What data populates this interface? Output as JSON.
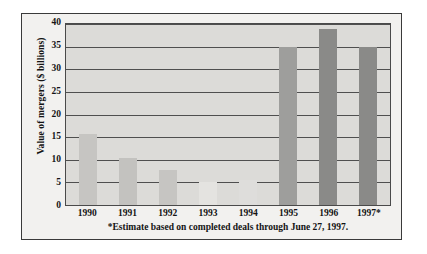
{
  "chart_data": {
    "type": "bar",
    "title": "",
    "xlabel": "",
    "ylabel": "Value of mergers ($ billions)",
    "categories": [
      "1990",
      "1991",
      "1992",
      "1993",
      "1994",
      "1995",
      "1996",
      "1997*"
    ],
    "values": [
      15.7,
      10.3,
      7.8,
      5.0,
      5.5,
      35.0,
      39.0,
      35.0
    ],
    "bar_colors": [
      "#c6c5c2",
      "#c3c2bf",
      "#c6c5c2",
      "#e4e3e0",
      "#dedddb",
      "#9e9e9c",
      "#8a8a88",
      "#8a8a88"
    ],
    "ylim": [
      0,
      40
    ],
    "yticks": [
      0,
      5,
      10,
      15,
      20,
      25,
      30,
      35,
      40
    ],
    "ytick_labels": [
      "0",
      "5",
      "10",
      "15",
      "20",
      "25",
      "30",
      "35",
      "40"
    ],
    "grid": true,
    "legend": "none",
    "annotations": [
      "*Estimate based on completed deals through June 27, 1997."
    ],
    "plot_background": "#dcdbd8",
    "figure_background": "#f2f1ef",
    "axis_color": "#4a4a4a"
  },
  "footnote": "*Estimate based on completed deals through June 27, 1997."
}
